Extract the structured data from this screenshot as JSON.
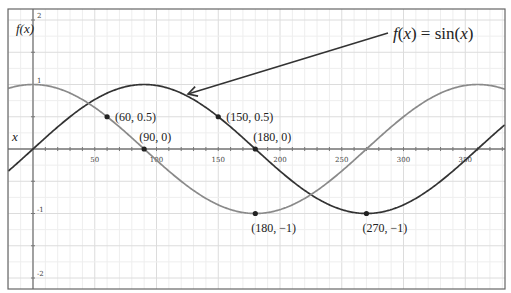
{
  "chart_data": {
    "type": "line",
    "title": "f(x) = sin(x)",
    "xlabel": "x",
    "ylabel": "f(x)",
    "xlim": [
      -20,
      382
    ],
    "ylim": [
      -2.17,
      2.17
    ],
    "grid": true,
    "x_ticks": [
      50,
      100,
      150,
      200,
      250,
      300,
      350
    ],
    "x_tick_labels": [
      "50",
      "100",
      "150",
      "200",
      "250",
      "300",
      "350"
    ],
    "y_ticks": [
      2,
      1,
      -1,
      -2
    ],
    "y_tick_labels": [
      "2",
      "1",
      "-1",
      "-2"
    ],
    "series": [
      {
        "name": "sin(x)",
        "function": "sin",
        "color": "#333333",
        "unit": "degrees"
      },
      {
        "name": "cos(x)",
        "function": "cos",
        "color": "#8a8a8a",
        "unit": "degrees"
      }
    ],
    "points": [
      {
        "x": 60,
        "y": 0.5,
        "label": "(60, 0.5)",
        "series": "cos(x)",
        "label_dx": 8,
        "label_dy": 4
      },
      {
        "x": 90,
        "y": 0,
        "label": "(90, 0)",
        "series": "cos(x)",
        "label_dx": -5,
        "label_dy": -8
      },
      {
        "x": 150,
        "y": 0.5,
        "label": "(150, 0.5)",
        "series": "sin(x)",
        "label_dx": 8,
        "label_dy": 4
      },
      {
        "x": 180,
        "y": 0,
        "label": "(180, 0)",
        "series": "sin(x)",
        "label_dx": -2,
        "label_dy": -8
      },
      {
        "x": 180,
        "y": -1,
        "label": "(180, −1)",
        "series": "cos(x)",
        "label_dx": -4,
        "label_dy": 18
      },
      {
        "x": 270,
        "y": -1,
        "label": "(270, −1)",
        "series": "sin(x)",
        "label_dx": -4,
        "label_dy": 18
      }
    ],
    "annotations": [
      {
        "text": "f(x) = sin(x)",
        "target": "sin(x) curve",
        "arrow_from": [
          388,
          33
        ],
        "arrow_to": [
          188,
          94
        ]
      }
    ]
  },
  "labels": {
    "y_axis": "f(x)",
    "x_axis": "x",
    "title_annotation": "f(x) = sin(x)"
  }
}
